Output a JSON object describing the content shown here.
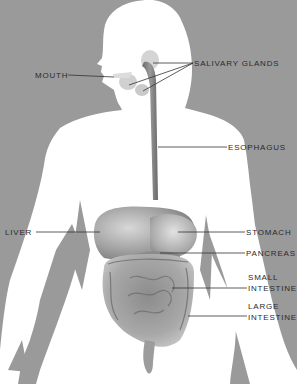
{
  "diagram": {
    "colors": {
      "background": "#9a9a9a",
      "body": "#ffffff",
      "organ_dark": "#6e6e6e",
      "organ_mid": "#a8a8a8",
      "organ_light": "#d2d2d2",
      "leader_line": "#333333",
      "label_text": "#2a2a2a"
    },
    "labels": [
      {
        "id": "mouth",
        "text": "MOUTH",
        "x": 35,
        "y": 71
      },
      {
        "id": "salivary-glands",
        "text": "SALIVARY  GLANDS",
        "x": 194,
        "y": 60
      },
      {
        "id": "esophagus",
        "text": "ESOPHAGUS",
        "x": 228,
        "y": 144
      },
      {
        "id": "liver",
        "text": "LIVER",
        "x": 5,
        "y": 229
      },
      {
        "id": "stomach",
        "text": "STOMACH",
        "x": 246,
        "y": 229
      },
      {
        "id": "pancreas",
        "text": "PANCREAS",
        "x": 246,
        "y": 250
      },
      {
        "id": "small-intestine-1",
        "text": "SMALL",
        "x": 248,
        "y": 273
      },
      {
        "id": "small-intestine-2",
        "text": "INTESTINE",
        "x": 248,
        "y": 284
      },
      {
        "id": "large-intestine-1",
        "text": "LARGE",
        "x": 248,
        "y": 302
      },
      {
        "id": "large-intestine-2",
        "text": "INTESTINE",
        "x": 248,
        "y": 313
      }
    ]
  }
}
